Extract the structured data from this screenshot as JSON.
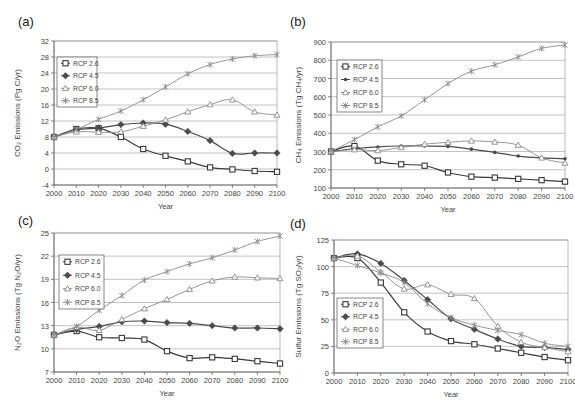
{
  "figure": {
    "panels": [
      {
        "id": "a",
        "label": "(a)"
      },
      {
        "id": "b",
        "label": "(b)"
      },
      {
        "id": "c",
        "label": "(c)"
      },
      {
        "id": "d",
        "label": "(d)"
      }
    ]
  },
  "chart_data": [
    {
      "panel": "(a)",
      "type": "line",
      "title": "",
      "xlabel": "Year",
      "ylabel": "CO₂ Emissions (Pg C/yr)",
      "x": [
        2000,
        2010,
        2020,
        2030,
        2040,
        2050,
        2060,
        2070,
        2080,
        2090,
        2100
      ],
      "yticks": [
        -4,
        0,
        4,
        8,
        12,
        16,
        20,
        24,
        28,
        32
      ],
      "ylim": [
        -4,
        32
      ],
      "grid": true,
      "legend_position": "upper-left",
      "series": [
        {
          "name": "RCP 2.6",
          "marker": "square",
          "values": [
            8.0,
            10.0,
            10.2,
            8.0,
            5.0,
            3.3,
            1.9,
            0.4,
            -0.1,
            -0.5,
            -0.7
          ]
        },
        {
          "name": "RCP 4.5",
          "marker": "diamond",
          "values": [
            8.0,
            9.8,
            10.2,
            11.1,
            11.5,
            11.2,
            9.4,
            7.1,
            3.9,
            4.0,
            4.0
          ]
        },
        {
          "name": "RCP 6.0",
          "marker": "triangle",
          "values": [
            8.0,
            9.3,
            9.2,
            9.3,
            10.7,
            12.3,
            14.3,
            16.1,
            17.3,
            14.3,
            13.5
          ]
        },
        {
          "name": "RCP 8.5",
          "marker": "star",
          "values": [
            8.0,
            9.9,
            12.4,
            14.5,
            17.3,
            20.5,
            23.8,
            26.1,
            27.5,
            28.3,
            28.6
          ]
        }
      ]
    },
    {
      "panel": "(b)",
      "type": "line",
      "title": "",
      "xlabel": "Year",
      "ylabel": "CH₄ Emissions (Tg CH₄/yr)",
      "x": [
        2000,
        2010,
        2020,
        2030,
        2040,
        2050,
        2060,
        2070,
        2080,
        2090,
        2100
      ],
      "yticks": [
        100,
        200,
        300,
        400,
        500,
        600,
        700,
        800,
        900
      ],
      "ylim": [
        100,
        900
      ],
      "grid": true,
      "legend_position": "upper-left",
      "series": [
        {
          "name": "RCP 2.6",
          "marker": "square",
          "values": [
            300,
            330,
            250,
            230,
            222,
            185,
            162,
            157,
            150,
            143,
            135
          ]
        },
        {
          "name": "RCP 4.5",
          "marker": "dot",
          "values": [
            300,
            315,
            325,
            330,
            330,
            328,
            313,
            295,
            275,
            265,
            260
          ]
        },
        {
          "name": "RCP 6.0",
          "marker": "triangle",
          "values": [
            300,
            310,
            305,
            322,
            340,
            350,
            358,
            352,
            335,
            265,
            237
          ]
        },
        {
          "name": "RCP 8.5",
          "marker": "star",
          "values": [
            300,
            365,
            435,
            495,
            583,
            672,
            740,
            775,
            818,
            865,
            883
          ]
        }
      ]
    },
    {
      "panel": "(c)",
      "type": "line",
      "title": "",
      "xlabel": "Year",
      "ylabel": "N₂O Emissions (Tg N₂O/yr)",
      "x": [
        2000,
        2010,
        2020,
        2030,
        2040,
        2050,
        2060,
        2070,
        2080,
        2090,
        2100
      ],
      "yticks": [
        7,
        10,
        13,
        16,
        19,
        22,
        25
      ],
      "ylim": [
        7,
        25
      ],
      "grid": true,
      "legend_position": "upper-left",
      "series": [
        {
          "name": "RCP 2.6",
          "marker": "square",
          "values": [
            11.8,
            12.3,
            11.5,
            11.4,
            11.2,
            9.7,
            8.8,
            8.9,
            8.7,
            8.4,
            8.1
          ]
        },
        {
          "name": "RCP 4.5",
          "marker": "diamond",
          "values": [
            11.8,
            12.5,
            12.9,
            13.5,
            13.6,
            13.4,
            13.3,
            13.0,
            12.7,
            12.7,
            12.6
          ]
        },
        {
          "name": "RCP 6.0",
          "marker": "triangle",
          "values": [
            11.8,
            12.8,
            12.4,
            13.8,
            15.2,
            16.4,
            17.7,
            18.8,
            19.3,
            19.2,
            19.1
          ]
        },
        {
          "name": "RCP 8.5",
          "marker": "star",
          "values": [
            11.8,
            12.9,
            15.0,
            16.9,
            18.9,
            20.0,
            21.0,
            21.8,
            22.8,
            23.9,
            24.6
          ]
        }
      ]
    },
    {
      "panel": "(d)",
      "type": "line",
      "title": "",
      "xlabel": "Year",
      "ylabel": "Sulfur Emissions (Tg SO₂/yr)",
      "x": [
        2000,
        2010,
        2020,
        2030,
        2040,
        2050,
        2060,
        2070,
        2080,
        2090,
        2100
      ],
      "yticks": [
        0,
        25,
        50,
        75,
        100,
        125
      ],
      "ylim": [
        0,
        125
      ],
      "grid": true,
      "legend_position": "lower-left",
      "series": [
        {
          "name": "RCP 2.6",
          "marker": "square",
          "values": [
            108,
            108,
            85,
            57,
            39,
            30,
            27,
            23,
            19,
            15,
            12
          ]
        },
        {
          "name": "RCP 4.5",
          "marker": "diamond",
          "values": [
            108,
            112,
            103,
            87,
            69,
            51,
            41,
            32,
            25,
            24,
            22
          ]
        },
        {
          "name": "RCP 6.0",
          "marker": "triangle",
          "values": [
            108,
            110,
            95,
            79,
            83,
            74,
            70,
            44,
            29,
            24,
            20
          ]
        },
        {
          "name": "RCP 8.5",
          "marker": "star",
          "values": [
            108,
            101,
            94,
            85,
            65,
            52,
            45,
            40,
            36,
            28,
            25
          ]
        }
      ]
    }
  ],
  "layout": [
    {
      "plot": {
        "x0": 54,
        "y0": 41,
        "x1": 277,
        "y1": 185
      },
      "label_pos": [
        18,
        26
      ],
      "legend": {
        "x": 57,
        "y": 57,
        "w": 40,
        "h": 50
      },
      "ylabel_x": 20
    },
    {
      "plot": {
        "x0": 331,
        "y0": 42,
        "x1": 565,
        "y1": 188
      },
      "label_pos": [
        290,
        26
      ],
      "legend": {
        "x": 337,
        "y": 60,
        "w": 45,
        "h": 52
      },
      "ylabel_x": 301
    },
    {
      "plot": {
        "x0": 54,
        "y0": 233,
        "x1": 280,
        "y1": 372
      },
      "label_pos": [
        18,
        219
      ],
      "legend": {
        "x": 59,
        "y": 255,
        "w": 45,
        "h": 54
      },
      "ylabel_x": 20
    },
    {
      "plot": {
        "x0": 334,
        "y0": 240,
        "x1": 568,
        "y1": 373
      },
      "label_pos": [
        290,
        222
      ],
      "legend": {
        "x": 337,
        "y": 298,
        "w": 46,
        "h": 50
      },
      "ylabel_x": 301
    }
  ],
  "style": {
    "line_color": "#555555",
    "series_colors": [
      "#3a3a3a",
      "#4a4a4a",
      "#8a8a8a",
      "#8a8a8a"
    ],
    "grid_color": "#9a9a9a",
    "axis_color": "#555555",
    "text_color": "#444444"
  }
}
